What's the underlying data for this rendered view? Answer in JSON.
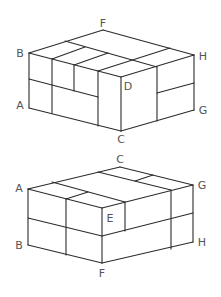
{
  "figures": [
    {
      "id": "top-box",
      "labels": [
        {
          "text": "F",
          "x": 103,
          "y": 27
        },
        {
          "text": "B",
          "x": 20,
          "y": 57
        },
        {
          "text": "H",
          "x": 203,
          "y": 60
        },
        {
          "text": "A",
          "x": 20,
          "y": 109
        },
        {
          "text": "D",
          "x": 128,
          "y": 90
        },
        {
          "text": "G",
          "x": 203,
          "y": 114
        },
        {
          "text": "C",
          "x": 121,
          "y": 143
        }
      ],
      "lines": [
        [
          29,
          53,
          103,
          30
        ],
        [
          103,
          30,
          194,
          55
        ],
        [
          29,
          53,
          121,
          77
        ],
        [
          121,
          77,
          194,
          55
        ],
        [
          29,
          53,
          29,
          108
        ],
        [
          29,
          108,
          121,
          131
        ],
        [
          121,
          131,
          194,
          110
        ],
        [
          194,
          55,
          194,
          110
        ],
        [
          121,
          77,
          121,
          131
        ],
        [
          65,
          41,
          157,
          67
        ],
        [
          170,
          48,
          98,
          71
        ],
        [
          85,
          47,
          52,
          59
        ],
        [
          108,
          53,
          74,
          65
        ],
        [
          52,
          59,
          52,
          113
        ],
        [
          74,
          65,
          74,
          91
        ],
        [
          98,
          71,
          98,
          126
        ],
        [
          29,
          79,
          98,
          97
        ],
        [
          157,
          67,
          157,
          121
        ],
        [
          157,
          93,
          194,
          83
        ]
      ]
    },
    {
      "id": "bottom-box",
      "labels": [
        {
          "text": "C",
          "x": 120,
          "y": 163
        },
        {
          "text": "A",
          "x": 19,
          "y": 192
        },
        {
          "text": "G",
          "x": 202,
          "y": 189
        },
        {
          "text": "E",
          "x": 110,
          "y": 222
        },
        {
          "text": "B",
          "x": 19,
          "y": 249
        },
        {
          "text": "H",
          "x": 202,
          "y": 246
        },
        {
          "text": "F",
          "x": 102,
          "y": 277
        }
      ],
      "lines": [
        [
          28,
          189,
          120,
          167
        ],
        [
          120,
          167,
          193,
          185
        ],
        [
          28,
          189,
          102,
          208
        ],
        [
          102,
          208,
          193,
          185
        ],
        [
          28,
          189,
          28,
          245
        ],
        [
          28,
          245,
          102,
          263
        ],
        [
          102,
          263,
          193,
          242
        ],
        [
          193,
          185,
          193,
          242
        ],
        [
          102,
          208,
          102,
          263
        ],
        [
          52,
          182,
          125,
          202
        ],
        [
          98,
          172,
          171,
          190
        ],
        [
          153,
          175,
          135,
          181
        ],
        [
          88,
          192,
          66,
          199
        ],
        [
          66,
          199,
          66,
          255
        ],
        [
          125,
          202,
          125,
          231
        ],
        [
          171,
          190,
          171,
          249
        ],
        [
          28,
          218,
          102,
          236
        ],
        [
          102,
          236,
          193,
          213
        ]
      ]
    }
  ],
  "colors": {
    "line": "#2b2b2b",
    "label": "#555555",
    "background": "#ffffff"
  }
}
